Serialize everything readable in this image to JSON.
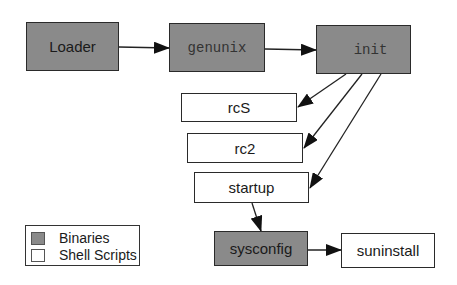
{
  "diagram": {
    "nodes": [
      {
        "id": "loader",
        "label": "Loader",
        "kind": "binary"
      },
      {
        "id": "genunix",
        "label": "genunix",
        "kind": "binary"
      },
      {
        "id": "init",
        "label": "init",
        "kind": "binary"
      },
      {
        "id": "rcS",
        "label": "rcS",
        "kind": "shell-script"
      },
      {
        "id": "rc2",
        "label": "rc2",
        "kind": "shell-script"
      },
      {
        "id": "startup",
        "label": "startup",
        "kind": "shell-script"
      },
      {
        "id": "sysconfig",
        "label": "sysconfig",
        "kind": "binary"
      },
      {
        "id": "suninstall",
        "label": "suninstall",
        "kind": "shell-script"
      }
    ],
    "edges": [
      {
        "from": "loader",
        "to": "genunix"
      },
      {
        "from": "genunix",
        "to": "init"
      },
      {
        "from": "init",
        "to": "rcS"
      },
      {
        "from": "init",
        "to": "rc2"
      },
      {
        "from": "init",
        "to": "startup"
      },
      {
        "from": "startup",
        "to": "sysconfig"
      },
      {
        "from": "sysconfig",
        "to": "suninstall"
      }
    ]
  },
  "legend": {
    "items": [
      {
        "label": "Binaries",
        "color": "#8a8a8a"
      },
      {
        "label": "Shell Scripts",
        "color": "#ffffff"
      }
    ]
  },
  "colors": {
    "binary_fill": "#8a8a8a",
    "script_fill": "#ffffff",
    "stroke": "#2a2a2a"
  }
}
